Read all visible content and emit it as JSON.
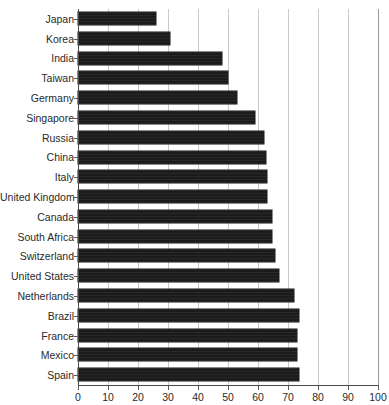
{
  "chart_data": {
    "type": "bar",
    "orientation": "horizontal",
    "title": "",
    "xlabel": "",
    "ylabel": "",
    "xlim": [
      0,
      100
    ],
    "xticks": [
      0,
      10,
      20,
      30,
      40,
      50,
      60,
      70,
      80,
      90,
      100
    ],
    "grid": "vertical",
    "legend": "none",
    "bar_color": "#1b1b1b",
    "categories": [
      "Japan",
      "Korea",
      "India",
      "Taiwan",
      "Germany",
      "Singapore",
      "Russia",
      "China",
      "Italy",
      "United Kingdom",
      "Canada",
      "South Africa",
      "Switzerland",
      "United States",
      "Netherlands",
      "Brazil",
      "France",
      "Mexico",
      "Spain"
    ],
    "values": [
      26,
      30.5,
      48,
      50,
      53,
      59,
      62,
      62.5,
      63,
      63,
      64.5,
      64.5,
      65.5,
      67,
      72,
      73.5,
      73,
      73,
      73.5
    ]
  }
}
